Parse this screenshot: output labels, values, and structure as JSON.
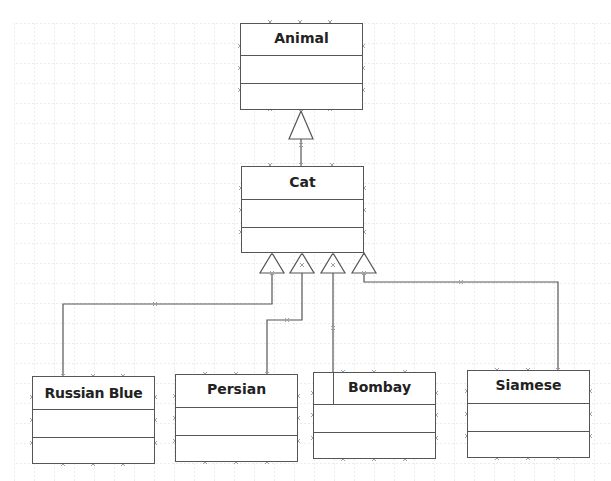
{
  "diagram": {
    "type": "uml-class-inheritance",
    "colors": {
      "background": "#ffffff",
      "grid": "#d8d8d8",
      "line": "#555555",
      "text": "#222222",
      "handle": "#a0a0a0"
    },
    "classes": [
      {
        "id": "animal",
        "name": "Animal",
        "x": 240,
        "y": 23,
        "w": 123,
        "h": 87,
        "sep1": 31,
        "sep2": 59
      },
      {
        "id": "cat",
        "name": "Cat",
        "x": 241,
        "y": 166,
        "w": 123,
        "h": 87,
        "sep1": 32,
        "sep2": 60
      },
      {
        "id": "russian-blue",
        "name": "Russian Blue",
        "x": 32,
        "y": 376,
        "w": 123,
        "h": 88,
        "sep1": 32,
        "sep2": 60
      },
      {
        "id": "persian",
        "name": "Persian",
        "x": 175,
        "y": 374,
        "w": 123,
        "h": 88,
        "sep1": 32,
        "sep2": 60
      },
      {
        "id": "bombay",
        "name": "Bombay",
        "x": 313,
        "y": 372,
        "w": 123,
        "h": 87,
        "sep1": 31,
        "sep2": 59
      },
      {
        "id": "siamese",
        "name": "Siamese",
        "x": 467,
        "y": 370,
        "w": 123,
        "h": 88,
        "sep1": 32,
        "sep2": 60
      }
    ],
    "relationships": [
      {
        "type": "generalization",
        "from": "Cat",
        "to": "Animal"
      },
      {
        "type": "generalization",
        "from": "Russian Blue",
        "to": "Cat"
      },
      {
        "type": "generalization",
        "from": "Persian",
        "to": "Cat"
      },
      {
        "type": "generalization",
        "from": "Bombay",
        "to": "Cat"
      },
      {
        "type": "generalization",
        "from": "Siamese",
        "to": "Cat"
      }
    ]
  }
}
